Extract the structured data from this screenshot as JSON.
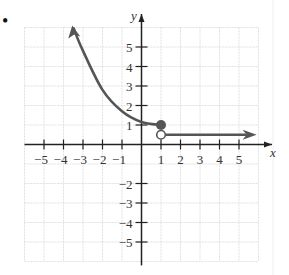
{
  "chart_data": {
    "type": "line",
    "title": "",
    "xlabel": "x",
    "ylabel": "y",
    "xlim": [
      -6,
      6
    ],
    "ylim": [
      -6,
      6
    ],
    "grid": true,
    "x_ticks": [
      "-5",
      "-4",
      "-3",
      "-2",
      "-1",
      "1",
      "2",
      "3",
      "4",
      "5"
    ],
    "y_ticks": [
      "5",
      "4",
      "3",
      "2",
      "1",
      "-2",
      "-3",
      "-4",
      "-5"
    ],
    "series": [
      {
        "name": "left piece (x <= 1), decreasing curve",
        "points": [
          [
            -3.5,
            6
          ],
          [
            -3,
            4.8
          ],
          [
            -2,
            2.8
          ],
          [
            -1,
            1.7
          ],
          [
            0,
            1.15
          ],
          [
            1,
            1
          ]
        ],
        "left_arrow": true,
        "endpoint": {
          "x": 1,
          "y": 1,
          "style": "closed"
        }
      },
      {
        "name": "right piece (x > 1), constant",
        "points": [
          [
            1,
            0.5
          ],
          [
            5.8,
            0.5
          ]
        ],
        "right_arrow": true,
        "startpoint": {
          "x": 1,
          "y": 0.5,
          "style": "open"
        }
      }
    ],
    "colors": {
      "curve": "#555555",
      "axis": "#222222",
      "grid": "#d8d8d8"
    }
  },
  "labels": {
    "x_axis": "x",
    "y_axis": "y",
    "bullet": "•"
  }
}
